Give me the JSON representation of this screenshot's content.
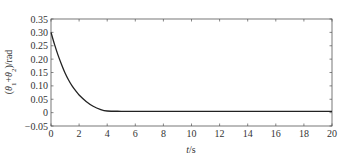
{
  "chart_data": {
    "type": "line",
    "title": "",
    "xlabel": "t/s",
    "xlabel_italic_part": "t",
    "xlabel_rest": "/s",
    "ylabel": "(θ1+θ2)/rad",
    "xlim": [
      0,
      20
    ],
    "ylim": [
      -0.05,
      0.35
    ],
    "grid": false,
    "legend": null,
    "x_ticks": [
      0,
      2,
      4,
      6,
      8,
      10,
      12,
      14,
      16,
      18,
      20
    ],
    "x_tick_labels": [
      "0",
      "2",
      "4",
      "6",
      "8",
      "10",
      "12",
      "14",
      "16",
      "18",
      "20"
    ],
    "y_ticks": [
      -0.05,
      0,
      0.05,
      0.1,
      0.15,
      0.2,
      0.25,
      0.3,
      0.35
    ],
    "y_tick_labels": [
      "−0.05",
      "0",
      "0.05",
      "0.10",
      "0.15",
      "0.20",
      "0.25",
      "0.30",
      "0.35"
    ],
    "series": [
      {
        "name": "θ1+θ2",
        "color": "#222222",
        "x": [
          0,
          0.25,
          0.5,
          0.75,
          1.0,
          1.25,
          1.5,
          1.75,
          2.0,
          2.5,
          3.0,
          3.5,
          4.0,
          5,
          6,
          8,
          10,
          12,
          14,
          16,
          18,
          20
        ],
        "y": [
          0.3,
          0.255,
          0.215,
          0.18,
          0.148,
          0.122,
          0.1,
          0.082,
          0.066,
          0.042,
          0.024,
          0.012,
          0.006,
          0.005,
          0.005,
          0.005,
          0.005,
          0.005,
          0.005,
          0.005,
          0.005,
          0.005
        ]
      }
    ]
  },
  "colors": {
    "axis": "#555555",
    "line": "#222222",
    "background": "#ffffff"
  }
}
